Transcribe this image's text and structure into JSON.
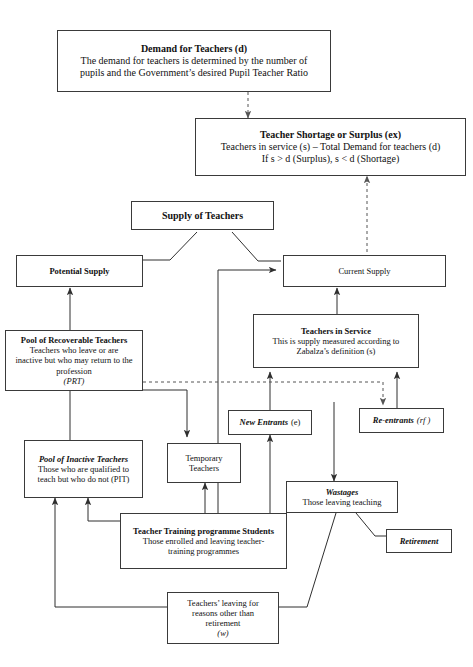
{
  "diagram": {
    "boxes": {
      "demand": {
        "title": "Demand for Teachers (d)",
        "line1": "The demand for teachers is determined by the number of",
        "line2": "pupils and the Government’s desired Pupil Teacher Ratio"
      },
      "shortage": {
        "title": "Teacher Shortage or Surplus (ex)",
        "line1": "Teachers in service (s) – Total Demand for teachers (d)",
        "line2": "If s > d (Surplus), s < d (Shortage)"
      },
      "supply_of_teachers": {
        "title": "Supply of Teachers"
      },
      "potential_supply": {
        "title": "Potential Supply"
      },
      "current_supply": {
        "title": "Current Supply"
      },
      "prt": {
        "title": "Pool of Recoverable Teachers",
        "line1": "Teachers who leave or are",
        "line2": "inactive but who may return to the",
        "line3": "profession",
        "line4": "(PRT)"
      },
      "teachers_in_service": {
        "title": "Teachers in Service",
        "line1": "This is supply measured according to",
        "line2": "Zabalza’s definition (s)"
      },
      "new_entrants": {
        "title": "New Entrants",
        "symbol": "(e)"
      },
      "re_entrants": {
        "title": "Re-entrants",
        "symbol": "(rf )"
      },
      "pit": {
        "title": "Pool of Inactive Teachers",
        "line1": "Those who are qualified to",
        "line2": "teach but who do not (PIT)"
      },
      "temporary_teachers": {
        "line1": "Temporary",
        "line2": "Teachers"
      },
      "wastages": {
        "title": "Wastages",
        "line1": "Those leaving teaching"
      },
      "retirement": {
        "title": "Retirement"
      },
      "teacher_training": {
        "title": "Teacher Training programme Students",
        "line1": "Those enrolled and leaving teacher-",
        "line2": "training programmes"
      },
      "leaving_other": {
        "line1": "Teachers’ leaving for",
        "line2": "reasons other than",
        "line3": "retirement",
        "line4": "(w)"
      }
    },
    "colors": {
      "box_border": "#3a3a3a",
      "connector": "#2f2f2f",
      "background": "#ffffff",
      "text": "#111111"
    }
  }
}
